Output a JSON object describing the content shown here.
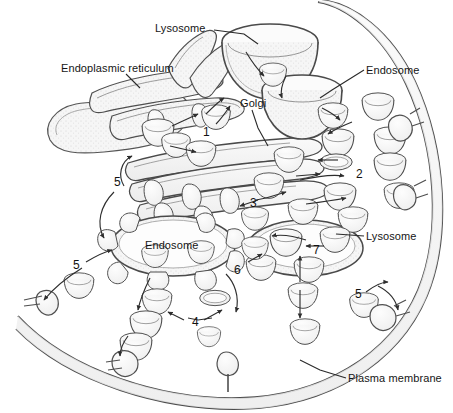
{
  "figure": {
    "background_color": "#ffffff",
    "line_color": "#3a3a3a",
    "fill_color": "#f4f4f4",
    "text_color": "#151515",
    "width": 453,
    "height": 413
  },
  "labels": [
    {
      "id": "lysosome-top",
      "text": "Lysosome",
      "x": 155,
      "y": 22
    },
    {
      "id": "endoplasmic",
      "text": "Endoplasmic reticulum",
      "x": 61,
      "y": 62
    },
    {
      "id": "endosome-right",
      "text": "Endosome",
      "x": 366,
      "y": 64
    },
    {
      "id": "golgi",
      "text": "Golgi",
      "x": 240,
      "y": 97
    },
    {
      "id": "endosome-center",
      "text": "Endosome",
      "x": 145,
      "y": 239
    },
    {
      "id": "lysosome-right",
      "text": "Lysosome",
      "x": 366,
      "y": 230
    },
    {
      "id": "plasma-membrane",
      "text": "Plasma membrane",
      "x": 348,
      "y": 372
    }
  ],
  "step_numbers": [
    {
      "id": "step-1",
      "text": "1",
      "x": 203,
      "y": 126
    },
    {
      "id": "step-2",
      "text": "2",
      "x": 356,
      "y": 168
    },
    {
      "id": "step-3",
      "text": "3",
      "x": 250,
      "y": 197
    },
    {
      "id": "step-4",
      "text": "4",
      "x": 192,
      "y": 316
    },
    {
      "id": "step-5a",
      "text": "5",
      "x": 114,
      "y": 176
    },
    {
      "id": "step-5b",
      "text": "5",
      "x": 73,
      "y": 259
    },
    {
      "id": "step-5c",
      "text": "5",
      "x": 355,
      "y": 288
    },
    {
      "id": "step-6",
      "text": "6",
      "x": 234,
      "y": 264
    },
    {
      "id": "step-7",
      "text": "7",
      "x": 313,
      "y": 244
    }
  ],
  "organelles": {
    "lysosome_top": {
      "cx": 270,
      "cy": 55,
      "rx": 48,
      "ry": 42
    },
    "endosome_right": {
      "cx": 300,
      "cy": 98,
      "rx": 40,
      "ry": 33
    },
    "endosome_center": {
      "cx": 173,
      "cy": 246,
      "rx": 62,
      "ry": 30
    },
    "lysosome_right": {
      "cx": 305,
      "cy": 248,
      "rx": 58,
      "ry": 28
    }
  },
  "vesicle_count": 34,
  "coated_pit_count": 6
}
